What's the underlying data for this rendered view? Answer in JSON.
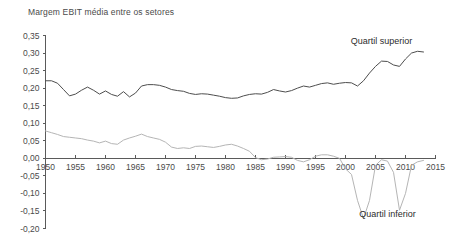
{
  "chart_data": {
    "type": "line",
    "title": "Margem EBIT média entre os setores",
    "xlabel": "",
    "ylabel": "",
    "xlim": [
      1950,
      2015
    ],
    "ylim": [
      -0.2,
      0.35
    ],
    "grid": false,
    "legend_position": "inline-annotation",
    "y_ticks": [
      0.35,
      0.3,
      0.25,
      0.2,
      0.15,
      0.1,
      0.05,
      0.0,
      -0.05,
      -0.1,
      -0.15,
      -0.2
    ],
    "y_tick_labels": [
      "0,35",
      "0,30",
      "0,25",
      "0,20",
      "0,15",
      "0,10",
      "0,05",
      "0,00",
      "-0,05",
      "-0,10",
      "-0,15",
      "-0,20"
    ],
    "x_ticks": [
      1950,
      1955,
      1960,
      1965,
      1970,
      1975,
      1980,
      1985,
      1990,
      1995,
      2000,
      2005,
      2010,
      2015
    ],
    "x_tick_labels": [
      "1950",
      "1955",
      "1960",
      "1965",
      "1970",
      "1975",
      "1980",
      "1985",
      "1990",
      "1995",
      "2000",
      "2005",
      "2010",
      "2015"
    ],
    "series": [
      {
        "name": "Quartil superior",
        "color": "#4d4d4d",
        "annotation": "Quartil superior",
        "annotation_x": 2006,
        "annotation_y": 0.325,
        "x": [
          1950,
          1951,
          1952,
          1953,
          1954,
          1955,
          1956,
          1957,
          1958,
          1959,
          1960,
          1961,
          1962,
          1963,
          1964,
          1965,
          1966,
          1967,
          1968,
          1969,
          1970,
          1971,
          1972,
          1973,
          1974,
          1975,
          1976,
          1977,
          1978,
          1979,
          1980,
          1981,
          1982,
          1983,
          1984,
          1985,
          1986,
          1987,
          1988,
          1989,
          1990,
          1991,
          1992,
          1993,
          1994,
          1995,
          1996,
          1997,
          1998,
          1999,
          2000,
          2001,
          2002,
          2003,
          2004,
          2005,
          2006,
          2007,
          2008,
          2009,
          2010,
          2011,
          2012,
          2013
        ],
        "values": [
          0.221,
          0.221,
          0.214,
          0.196,
          0.178,
          0.183,
          0.194,
          0.203,
          0.194,
          0.183,
          0.192,
          0.182,
          0.177,
          0.19,
          0.175,
          0.186,
          0.206,
          0.21,
          0.21,
          0.208,
          0.203,
          0.196,
          0.193,
          0.191,
          0.185,
          0.182,
          0.184,
          0.183,
          0.18,
          0.177,
          0.173,
          0.171,
          0.172,
          0.178,
          0.182,
          0.184,
          0.183,
          0.188,
          0.196,
          0.192,
          0.189,
          0.193,
          0.2,
          0.206,
          0.203,
          0.208,
          0.213,
          0.215,
          0.211,
          0.214,
          0.216,
          0.215,
          0.206,
          0.221,
          0.243,
          0.262,
          0.277,
          0.276,
          0.266,
          0.262,
          0.283,
          0.3,
          0.305,
          0.303
        ]
      },
      {
        "name": "Quartil inferior",
        "color": "#b5b5b5",
        "annotation": "Quartil inferior",
        "annotation_x": 2007,
        "annotation_y": -0.168,
        "x": [
          1950,
          1951,
          1952,
          1953,
          1954,
          1955,
          1956,
          1957,
          1958,
          1959,
          1960,
          1961,
          1962,
          1963,
          1964,
          1965,
          1966,
          1967,
          1968,
          1969,
          1970,
          1971,
          1972,
          1973,
          1974,
          1975,
          1976,
          1977,
          1978,
          1979,
          1980,
          1981,
          1982,
          1983,
          1984,
          1985,
          1986,
          1987,
          1988,
          1989,
          1990,
          1991,
          1992,
          1993,
          1994,
          1995,
          1996,
          1997,
          1998,
          1999,
          2000,
          2001,
          2002,
          2003,
          2004,
          2005,
          2006,
          2007,
          2008,
          2009,
          2010,
          2011,
          2012,
          2013
        ],
        "values": [
          0.078,
          0.073,
          0.068,
          0.062,
          0.06,
          0.058,
          0.056,
          0.052,
          0.049,
          0.044,
          0.049,
          0.042,
          0.04,
          0.052,
          0.058,
          0.063,
          0.069,
          0.062,
          0.058,
          0.054,
          0.046,
          0.032,
          0.028,
          0.03,
          0.028,
          0.034,
          0.035,
          0.033,
          0.031,
          0.034,
          0.038,
          0.04,
          0.035,
          0.028,
          0.02,
          0.002,
          -0.004,
          -0.002,
          0.003,
          0.004,
          0.005,
          0.003,
          -0.006,
          -0.01,
          -0.004,
          0.006,
          0.01,
          0.01,
          0.006,
          0.0,
          -0.03,
          -0.046,
          -0.12,
          -0.172,
          -0.12,
          -0.02,
          -0.004,
          -0.008,
          -0.04,
          -0.148,
          -0.1,
          -0.02,
          -0.01,
          -0.006
        ]
      }
    ]
  }
}
